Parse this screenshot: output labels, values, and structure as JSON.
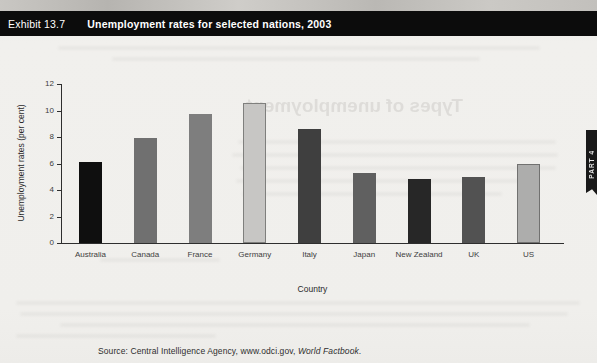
{
  "header": {
    "exhibit_label": "Exhibit 13.7",
    "title": "Unemployment rates for selected nations, 2003",
    "bar_color": "#0c0c0c",
    "text_color": "#ffffff"
  },
  "side_tab": {
    "label": "PART 4",
    "color": "#191919"
  },
  "chart_data": {
    "type": "bar",
    "title": "Unemployment rates for selected nations, 2003",
    "categories": [
      "Australia",
      "Canada",
      "France",
      "Germany",
      "Italy",
      "Japan",
      "New Zealand",
      "UK",
      "US"
    ],
    "values": [
      6.1,
      7.9,
      9.7,
      10.6,
      8.6,
      5.3,
      4.8,
      5.0,
      6.0
    ],
    "bar_colors": [
      "#0f0f0f",
      "#707070",
      "#7e7e7e",
      "#c7c6c4",
      "#3f3f3f",
      "#606060",
      "#272727",
      "#525252",
      "#adadac"
    ],
    "xlabel": "Country",
    "ylabel": "Unemployment rates (per cent)",
    "ylim": [
      0,
      12
    ],
    "yticks": [
      0,
      2,
      4,
      6,
      8,
      10,
      12
    ],
    "grid": false,
    "legend": null
  },
  "bleed_through": {
    "headline": "Types of unemployment"
  },
  "source": {
    "prefix": "Source: Central Intelligence Agency, www.odci.gov, ",
    "italic": "World Factbook",
    "suffix": "."
  }
}
